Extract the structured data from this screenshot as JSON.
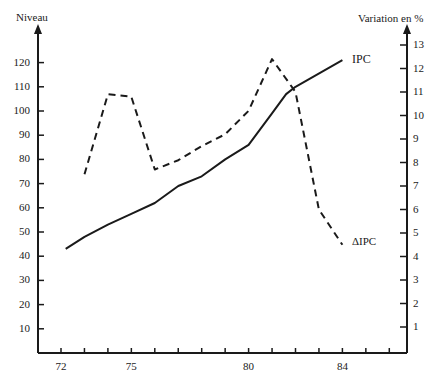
{
  "chart_data": {
    "type": "line",
    "title": "",
    "left_axis": {
      "label": "Niveau",
      "ticks": [
        "10",
        "20",
        "30",
        "40",
        "50",
        "60",
        "70",
        "80",
        "90",
        "100",
        "110",
        "120"
      ],
      "range": [
        0,
        130
      ]
    },
    "right_axis": {
      "label": "Variation en %",
      "ticks": [
        "1",
        "2",
        "3",
        "4",
        "5",
        "6",
        "7",
        "8",
        "9",
        "10",
        "11",
        "12",
        "13"
      ],
      "range": [
        0,
        13.5
      ]
    },
    "x_axis": {
      "label": "",
      "tick_labels": [
        "72",
        "75",
        "80",
        "84"
      ],
      "range": [
        71,
        87
      ]
    },
    "grid": false,
    "legend": "inline labels",
    "series": [
      {
        "name": "IPC",
        "axis": "left",
        "style": "solid",
        "x": [
          72.2,
          73,
          74,
          75,
          76,
          77,
          78,
          79,
          80,
          81,
          81.6,
          82,
          84
        ],
        "values": [
          43,
          48,
          53,
          57.5,
          62,
          69,
          73,
          80,
          86,
          99,
          107,
          110,
          121
        ]
      },
      {
        "name": "ΔIPC",
        "axis": "right",
        "style": "dashed",
        "x": [
          73,
          74,
          75,
          76,
          77,
          78,
          79,
          80,
          81,
          82,
          82.5,
          83,
          84
        ],
        "values": [
          7.5,
          10.9,
          10.8,
          7.7,
          8.1,
          8.7,
          9.2,
          10.2,
          12.4,
          11.0,
          8.5,
          6.0,
          4.5
        ]
      }
    ]
  },
  "labels": {
    "left_axis_title": "Niveau",
    "right_axis_title": "Variation en %",
    "ipc_label": "IPC",
    "delta_ipc_label": "ΔIPC"
  },
  "colors": {
    "line": "#1a1a1a",
    "background": "#ffffff"
  }
}
